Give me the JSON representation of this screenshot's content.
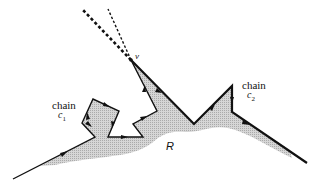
{
  "figure": {
    "labels": {
      "vertex": "v",
      "region": "R",
      "chain1": {
        "word": "chain",
        "symbol": "c",
        "subscript": "1"
      },
      "chain2": {
        "word": "chain",
        "symbol": "c",
        "subscript": "2"
      }
    },
    "colors": {
      "stroke": "#111111",
      "shade": "#c8c8c8",
      "background": "#ffffff"
    },
    "vertex_v": [
      131,
      60
    ],
    "chain1_points": [
      [
        13,
        179
      ],
      [
        95,
        137
      ],
      [
        82,
        123
      ],
      [
        93,
        99
      ],
      [
        119,
        111
      ],
      [
        108,
        137
      ],
      [
        143,
        137
      ],
      [
        133,
        124
      ],
      [
        157,
        111
      ],
      [
        131,
        60
      ]
    ],
    "chain2_points": [
      [
        131,
        60
      ],
      [
        194,
        124
      ],
      [
        232,
        86
      ],
      [
        232,
        112
      ],
      [
        307,
        163
      ]
    ],
    "dashed_rays": [
      {
        "style": "thick",
        "from": [
          131,
          60
        ],
        "to": [
          82,
          9
        ]
      },
      {
        "style": "thin",
        "from": [
          131,
          60
        ],
        "to": [
          108,
          9
        ]
      }
    ]
  }
}
